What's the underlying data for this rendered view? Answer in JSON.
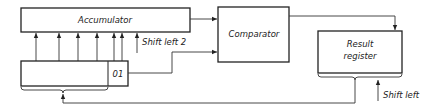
{
  "diagram": {
    "blocks": {
      "accumulator": {
        "label": "Accumulator"
      },
      "comparator": {
        "label": "Comparator"
      },
      "result_register": {
        "label_line1": "Result",
        "label_line2": "register"
      },
      "input_register": {
        "cell_label": "01"
      }
    },
    "annotations": {
      "shift_left_2": "Shift left 2",
      "shift_left": "Shift left"
    },
    "colors": {
      "line": "#222222",
      "background": "#ffffff"
    }
  }
}
